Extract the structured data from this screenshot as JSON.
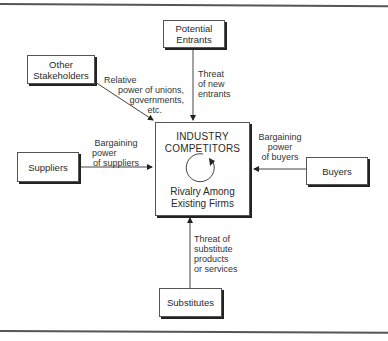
{
  "diagram": {
    "type": "five-forces",
    "center": {
      "title_line1": "INDUSTRY",
      "title_line2": "COMPETITORS",
      "subtitle_line1": "Rivalry Among",
      "subtitle_line2": "Existing Firms",
      "icon": "circular-arrow-icon"
    },
    "nodes": {
      "potential_entrants": {
        "line1": "Potential",
        "line2": "Entrants"
      },
      "other_stakeholders": {
        "line1": "Other",
        "line2": "Stakeholders"
      },
      "suppliers": {
        "label": "Suppliers"
      },
      "buyers": {
        "label": "Buyers"
      },
      "substitutes": {
        "label": "Substitutes"
      }
    },
    "edges": {
      "entrants": {
        "line1": "Threat",
        "line2": "of new",
        "line3": "entrants"
      },
      "stakeholders": {
        "line1": "Relative",
        "line2": "power of unions,",
        "line3": "governments,",
        "line4": "etc."
      },
      "suppliers": {
        "line1": "Bargaining",
        "line2": "power",
        "line3": "of suppliers"
      },
      "buyers": {
        "line1": "Bargaining",
        "line2": "power",
        "line3": "of buyers"
      },
      "substitutes": {
        "line1": "Threat of",
        "line2": "substitute",
        "line3": "products",
        "line4": "or services"
      }
    }
  }
}
